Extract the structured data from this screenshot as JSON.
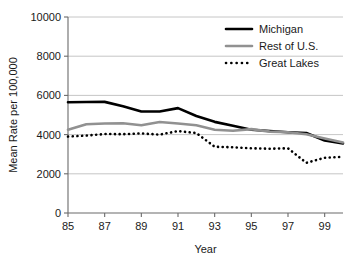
{
  "chart_data": {
    "type": "line",
    "title": "",
    "xlabel": "Year",
    "ylabel": "Mean Rate per 100,000",
    "xlim": [
      85,
      100
    ],
    "ylim": [
      0,
      10000
    ],
    "grid": true,
    "legend_position": "top-right",
    "x": [
      85,
      86,
      87,
      88,
      89,
      90,
      91,
      92,
      93,
      94,
      95,
      96,
      97,
      98,
      99,
      100
    ],
    "xtick_values": [
      85,
      87,
      89,
      91,
      93,
      95,
      97,
      99
    ],
    "xtick_labels": [
      "85",
      "87",
      "89",
      "91",
      "93",
      "95",
      "97",
      "99"
    ],
    "ytick_values": [
      0,
      2000,
      4000,
      6000,
      8000,
      10000
    ],
    "ytick_labels": [
      "0",
      "2000",
      "4000",
      "6000",
      "8000",
      "10000"
    ],
    "series": [
      {
        "name": "Michigan",
        "color": "#000000",
        "style": "solid",
        "width": 2.6,
        "values": [
          5650,
          5660,
          5670,
          5450,
          5180,
          5180,
          5350,
          4950,
          4650,
          4450,
          4250,
          4180,
          4120,
          4080,
          3700,
          3550
        ]
      },
      {
        "name": "Rest of U.S.",
        "color": "#919191",
        "style": "solid",
        "width": 2.6,
        "values": [
          4250,
          4530,
          4570,
          4580,
          4480,
          4640,
          4570,
          4480,
          4250,
          4200,
          4280,
          4150,
          4120,
          4020,
          3800,
          3600
        ]
      },
      {
        "name": "Great Lakes",
        "color": "#000000",
        "style": "dotted",
        "width": 2.6,
        "values": [
          3900,
          3950,
          4030,
          4020,
          4060,
          4000,
          4180,
          4080,
          3380,
          3350,
          3300,
          3280,
          3300,
          2560,
          2820,
          2870
        ]
      }
    ]
  },
  "legend": {
    "items": [
      {
        "label": "Michigan"
      },
      {
        "label": "Rest of U.S."
      },
      {
        "label": "Great Lakes"
      }
    ]
  },
  "axes": {
    "x_title": "Year",
    "y_title": "Mean Rate per 100,000"
  }
}
